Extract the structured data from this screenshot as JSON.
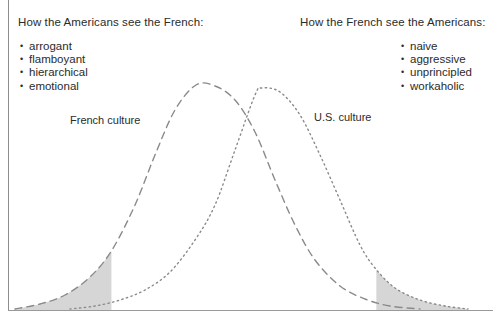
{
  "panel": {
    "left_heading": "How the Americans see the French:",
    "right_heading": "How the French see the Americans:",
    "left_bullets": [
      "arrogant",
      "flamboyant",
      "hierarchical",
      "emotional"
    ],
    "right_bullets": [
      "naive",
      "aggressive",
      "unprincipled",
      "workaholic"
    ],
    "french_curve_label": "French culture",
    "us_curve_label": "U.S. culture"
  },
  "colors": {
    "text": "#2b2b2b",
    "curve": "#8a8a8a",
    "shade": "#d6d6d6",
    "frame": "#8d8d8d"
  },
  "chart_data": {
    "type": "line",
    "title": "",
    "xlabel": "",
    "ylabel": "",
    "grid": false,
    "legend": "inline-annotations",
    "annotations": [
      "French culture",
      "U.S. culture"
    ],
    "baseline_y": 310,
    "xlim": [
      8,
      493
    ],
    "ylim": [
      310,
      85
    ],
    "shaded_regions": [
      {
        "name": "french-left-tail",
        "x_from": 15,
        "x_to": 112,
        "curve": "French culture",
        "fill": "#d6d6d6"
      },
      {
        "name": "us-right-tail",
        "x_from": 375,
        "x_to": 468,
        "curve": "U.S. culture",
        "fill": "#d6d6d6"
      }
    ],
    "series": [
      {
        "name": "French culture",
        "style": "dashed",
        "peak_x": 196,
        "peak_y": 85,
        "x": [
          15,
          40,
          65,
          90,
          112,
          135,
          155,
          175,
          196,
          215,
          235,
          255,
          275,
          295,
          315,
          340,
          365,
          390,
          420
        ],
        "y": [
          309,
          304,
          295,
          277,
          250,
          205,
          155,
          110,
          85,
          86,
          100,
          132,
          180,
          225,
          260,
          286,
          299,
          306,
          309
        ]
      },
      {
        "name": "U.S. culture",
        "style": "dotted",
        "peak_x": 262,
        "peak_y": 88,
        "x": [
          70,
          95,
          120,
          145,
          170,
          195,
          215,
          235,
          255,
          262,
          280,
          300,
          320,
          340,
          360,
          375,
          395,
          420,
          445,
          468
        ],
        "y": [
          309,
          306,
          300,
          290,
          272,
          240,
          205,
          150,
          95,
          88,
          92,
          115,
          155,
          200,
          245,
          268,
          288,
          300,
          306,
          309
        ]
      }
    ]
  }
}
